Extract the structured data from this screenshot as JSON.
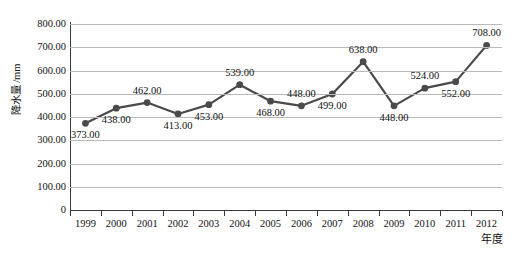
{
  "chart_data": {
    "type": "line",
    "title": "",
    "subtitle": "",
    "xlabel": "年度",
    "ylabel": "降水量 /mm",
    "categories": [
      "1999",
      "2000",
      "2001",
      "2002",
      "2003",
      "2004",
      "2005",
      "2006",
      "2007",
      "2008",
      "2009",
      "2010",
      "2011",
      "2012"
    ],
    "values": [
      373,
      438,
      462,
      413,
      453,
      539,
      468,
      448,
      499,
      638,
      448,
      524,
      552,
      708
    ],
    "point_labels": [
      "373.00",
      "438.00",
      "462.00",
      "413.00",
      "453.00",
      "539.00",
      "468.00",
      "448.00",
      "499.00",
      "638.00",
      "448.00",
      "524.00",
      "552.00",
      "708.00"
    ],
    "label_positions": [
      "below",
      "below",
      "above",
      "below",
      "below",
      "above",
      "below",
      "above",
      "below",
      "above",
      "below",
      "above",
      "below",
      "above"
    ],
    "ylim": [
      0,
      800
    ],
    "ytick_values": [
      0,
      100,
      200,
      300,
      400,
      500,
      600,
      700,
      800
    ],
    "ytick_labels": [
      "0",
      "100.00",
      "200.00",
      "300.00",
      "400.00",
      "500.00",
      "600.00",
      "700.00",
      "800.00"
    ],
    "grid": true,
    "legend": "none",
    "series_color": "#4a4a4a",
    "grid_color": "#b9b9b9",
    "axis_color": "#3a3a3a",
    "background_color": "#ffffff",
    "marker": "circle"
  }
}
